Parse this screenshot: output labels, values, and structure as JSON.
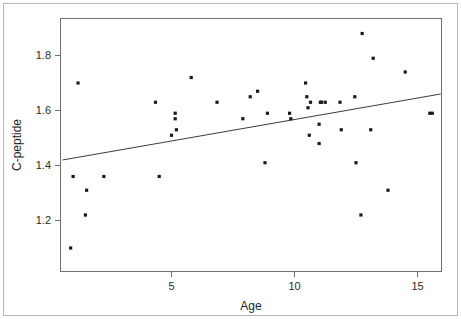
{
  "figure": {
    "background_color": "#ffffff",
    "border_color": "#b6b6b6",
    "axis_color": "#6f6f6f",
    "marker_color": "#1a1a1a",
    "line_color": "#3b3b3b"
  },
  "chart_data": {
    "type": "scatter",
    "title": "",
    "xlabel": "Age",
    "ylabel": "C-peptide",
    "xlim": [
      0.3,
      16.3
    ],
    "ylim": [
      1.08,
      1.91
    ],
    "xticks": [
      5,
      10,
      15
    ],
    "xtick_labels": [
      "5",
      "10",
      "15"
    ],
    "yticks": [
      1.2,
      1.4,
      1.6,
      1.8
    ],
    "ytick_labels": [
      "1.2",
      "1.4",
      "1.6",
      "1.8"
    ],
    "grid": false,
    "legend": null,
    "points": [
      {
        "x": 1.2,
        "y": 1.7
      },
      {
        "x": 1.0,
        "y": 1.36
      },
      {
        "x": 1.55,
        "y": 1.31
      },
      {
        "x": 1.5,
        "y": 1.22
      },
      {
        "x": 0.9,
        "y": 1.1
      },
      {
        "x": 2.25,
        "y": 1.36
      },
      {
        "x": 4.35,
        "y": 1.63
      },
      {
        "x": 4.5,
        "y": 1.36
      },
      {
        "x": 5.0,
        "y": 1.51
      },
      {
        "x": 5.15,
        "y": 1.59
      },
      {
        "x": 5.15,
        "y": 1.57
      },
      {
        "x": 5.2,
        "y": 1.53
      },
      {
        "x": 5.8,
        "y": 1.72
      },
      {
        "x": 6.85,
        "y": 1.63
      },
      {
        "x": 7.9,
        "y": 1.57
      },
      {
        "x": 8.2,
        "y": 1.65
      },
      {
        "x": 8.5,
        "y": 1.67
      },
      {
        "x": 8.9,
        "y": 1.59
      },
      {
        "x": 8.8,
        "y": 1.41
      },
      {
        "x": 9.8,
        "y": 1.59
      },
      {
        "x": 9.85,
        "y": 1.57
      },
      {
        "x": 10.45,
        "y": 1.7
      },
      {
        "x": 10.5,
        "y": 1.65
      },
      {
        "x": 10.55,
        "y": 1.61
      },
      {
        "x": 10.65,
        "y": 1.63
      },
      {
        "x": 10.6,
        "y": 1.51
      },
      {
        "x": 11.05,
        "y": 1.63
      },
      {
        "x": 11.1,
        "y": 1.63
      },
      {
        "x": 11.25,
        "y": 1.63
      },
      {
        "x": 11.0,
        "y": 1.55
      },
      {
        "x": 11.0,
        "y": 1.48
      },
      {
        "x": 11.85,
        "y": 1.63
      },
      {
        "x": 11.9,
        "y": 1.53
      },
      {
        "x": 12.45,
        "y": 1.65
      },
      {
        "x": 12.5,
        "y": 1.41
      },
      {
        "x": 12.75,
        "y": 1.88
      },
      {
        "x": 12.7,
        "y": 1.22
      },
      {
        "x": 13.2,
        "y": 1.79
      },
      {
        "x": 13.1,
        "y": 1.53
      },
      {
        "x": 13.8,
        "y": 1.31
      },
      {
        "x": 14.5,
        "y": 1.74
      },
      {
        "x": 15.5,
        "y": 1.59
      },
      {
        "x": 15.6,
        "y": 1.59
      }
    ],
    "fit_line": {
      "type": "linear-regression",
      "x0": 0.57,
      "y0": 1.42,
      "x1": 15.94,
      "y1": 1.66
    }
  }
}
